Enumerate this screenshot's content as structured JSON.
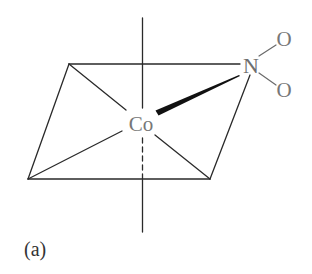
{
  "figure": {
    "type": "chemical-structure",
    "panel_label": "(a)",
    "atoms": {
      "center": "Co",
      "ligand_donor": "N",
      "oxygen_top": "O",
      "oxygen_bottom": "O"
    },
    "colors": {
      "lines": "#2a2a2a",
      "atom_text": "#777777",
      "label_text": "#333333",
      "background": "#ffffff"
    }
  }
}
